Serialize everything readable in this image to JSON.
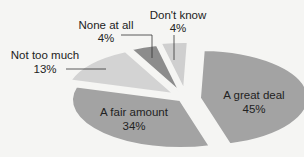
{
  "chart_data": {
    "type": "pie",
    "title": "",
    "categories": [
      "A great deal",
      "A fair amount",
      "Not too much",
      "None at all",
      "Don't know"
    ],
    "values": [
      45,
      34,
      13,
      4,
      4
    ],
    "labels": [
      "45%",
      "34%",
      "13%",
      "4%",
      "4%"
    ],
    "colors": [
      "#a3a3a3",
      "#a3a3a3",
      "#d3d3d3",
      "#8c8c8c",
      "#cfcfcf"
    ],
    "exploded": true,
    "legend": "none (direct labels)"
  },
  "slices": [
    {
      "name": "A great deal",
      "pct": "45%"
    },
    {
      "name": "A fair amount",
      "pct": "34%"
    },
    {
      "name": "Not too much",
      "pct": "13%"
    },
    {
      "name": "None at all",
      "pct": "4%"
    },
    {
      "name": "Don't know",
      "pct": "4%"
    }
  ]
}
